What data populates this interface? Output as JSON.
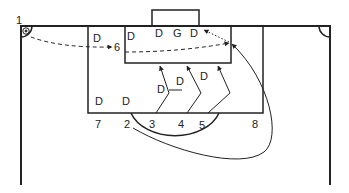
{
  "diagram": {
    "type": "soccer-set-piece-corner-kick",
    "colors": {
      "line": "#222222",
      "background": "#ffffff"
    },
    "player_numbers": [
      "1",
      "2",
      "3",
      "4",
      "5",
      "6",
      "7",
      "8"
    ],
    "defenders_label": "D",
    "goalkeeper_label": "G",
    "labels": {
      "n1": "1",
      "n2": "2",
      "n3": "3",
      "n4": "4",
      "n5": "5",
      "n6": "6",
      "n7": "7",
      "n8": "8",
      "d_left_box": "D",
      "d_goal_area_left": "D",
      "d_goal_left": "D",
      "g": "G",
      "d_goal_right": "D",
      "d_mid_left": "D",
      "d_mid_center": "D",
      "d_mid_right": "D",
      "d_edge_left": "D",
      "d_edge_right": "D"
    },
    "paths": {
      "corner_kick_to_6": "dashed",
      "cross_to_far_post": "dashed",
      "runs_3_4_5": "solid-zigzag",
      "run_2_loop_to_far_post": "solid-curve",
      "run_8_to_far_post": "solid",
      "flick_to_goal": "dotted"
    }
  }
}
